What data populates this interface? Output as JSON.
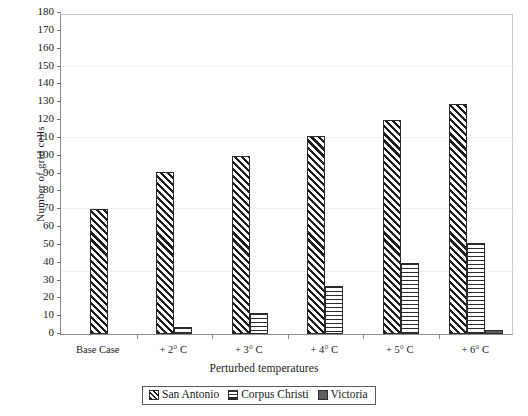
{
  "chart_data": {
    "type": "bar",
    "title": "",
    "xlabel": "Perturbed temperatures",
    "ylabel": "Number of grid cells",
    "categories": [
      "Base Case",
      "+ 2° C",
      "+ 3° C",
      "+ 4° C",
      "+ 5° C",
      "+ 6° C"
    ],
    "series": [
      {
        "name": "San Antonio",
        "pattern": "diagonal-hatch",
        "values": [
          70,
          91,
          100,
          111,
          120,
          129
        ]
      },
      {
        "name": "Corpus Christi",
        "pattern": "horizontal-lines",
        "values": [
          0,
          4,
          12,
          27,
          40,
          51
        ]
      },
      {
        "name": "Victoria",
        "pattern": "solid-gray",
        "values": [
          0,
          0,
          0,
          0,
          0,
          2
        ]
      }
    ],
    "ylim": [
      0,
      180
    ],
    "ytick_step": 10,
    "yticks": [
      0,
      10,
      20,
      30,
      40,
      50,
      60,
      70,
      80,
      90,
      100,
      110,
      120,
      130,
      140,
      150,
      160,
      170,
      180
    ],
    "grid": false,
    "legend_position": "bottom-center",
    "colors": {
      "ink": "#1d1d1d",
      "axis": "#8d8d8d",
      "victoria_fill": "#5e5e5e",
      "background": "#ffffff"
    }
  },
  "legend": {
    "entries": [
      {
        "label": "San Antonio"
      },
      {
        "label": "Corpus Christi"
      },
      {
        "label": "Victoria"
      }
    ]
  }
}
